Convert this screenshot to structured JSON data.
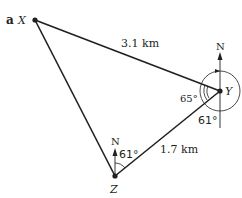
{
  "part_label": "a",
  "points": {
    "X": {
      "label": "X",
      "x": 35,
      "y": 20
    },
    "Y": {
      "label": "Y",
      "x": 220,
      "y": 91
    },
    "Z": {
      "label": "Z",
      "x": 115,
      "y": 176
    }
  },
  "distances": {
    "XY": "3.1 km",
    "ZY": "1.7 km"
  },
  "angles": {
    "at_Y_XYZ": "65°",
    "at_Y_south_to_Z": "61°",
    "at_Z_bearing": "61°"
  },
  "north_labels": {
    "at_Y": "N",
    "at_Z": "N"
  },
  "colors": {
    "ink": "#231f20",
    "background": "#ffffff"
  }
}
